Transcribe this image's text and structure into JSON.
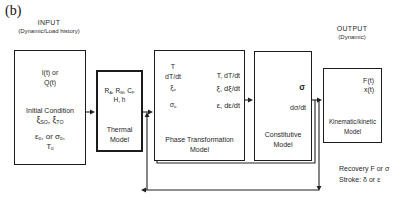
{
  "figure_label": "(b)",
  "input_section": {
    "title": "INPUT",
    "subtitle": "(Dynamic/Load history)",
    "box": {
      "signal_line1": "I(t) or",
      "signal_line2": "Q(t)",
      "initial_condition_label": "Initial Condition",
      "xi_line": [
        {
          "t": "ξ"
        },
        {
          "t": "SO",
          "sub": true
        },
        {
          "t": ", ξ"
        },
        {
          "t": "TO",
          "sub": true
        }
      ],
      "eps_line": [
        {
          "t": "ε"
        },
        {
          "t": "o",
          "sub": true
        },
        {
          "t": ", or "
        },
        {
          "t": "σ"
        },
        {
          "t": "o",
          "sub": true
        },
        {
          "t": ","
        }
      ],
      "temp_line": [
        {
          "t": "T"
        },
        {
          "t": "o",
          "sub": true
        }
      ]
    }
  },
  "thermal_model": {
    "params_line1": [
      {
        "t": "R"
      },
      {
        "t": "A",
        "sub": true
      },
      {
        "t": ", R"
      },
      {
        "t": "M",
        "sub": true
      },
      {
        "t": ", C"
      },
      {
        "t": "P",
        "sub": true
      }
    ],
    "params_line2": "H, h",
    "label_line1": "Thermal",
    "label_line2": "Model"
  },
  "phase_model": {
    "inputs": {
      "line1": "T",
      "line2": "dT/dt",
      "line3": [
        {
          "t": "ξ"
        },
        {
          "t": "o",
          "sub": true
        }
      ],
      "line4": [
        {
          "t": "σ"
        },
        {
          "t": "o",
          "sub": true
        }
      ]
    },
    "outputs": {
      "line1": "T, dT/dt",
      "line2": "ξ, dξ/dt",
      "line3": "ε, dε/dt"
    },
    "label_line1": "Phase Transformation",
    "label_line2": "Model"
  },
  "constitutive_model": {
    "output_line1": "σ",
    "output_line2": "dσ/dt",
    "label_line1": "Constitutive",
    "label_line2": "Model"
  },
  "kinematic_model": {
    "output_line1": "F(t)",
    "output_line2": "x(t)",
    "label_line1": "Kinematic/kinetic",
    "label_line2": "Model"
  },
  "output_section": {
    "title": "OUTPUT",
    "subtitle": "(Dynamic)",
    "note_line1": "Recovery F or σ",
    "note_line2": "Stroke: δ or ε"
  },
  "colors": {
    "line": "#222222",
    "text": "#1f1f1f",
    "background": "#ffffff"
  }
}
